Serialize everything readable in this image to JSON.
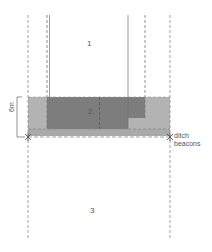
{
  "diagram": {
    "zones": [
      {
        "id": "zone-1",
        "label": "1"
      },
      {
        "id": "zone-2",
        "label": "2"
      },
      {
        "id": "zone-3",
        "label": "3"
      }
    ],
    "dimension": {
      "label": "6m"
    },
    "annotation": {
      "line1": "ditch",
      "line2": "beacons"
    },
    "colors": {
      "band_light": "#b3b3b3",
      "band_dark": "#7a7a7a",
      "strip": "#a6a6a6",
      "line": "#8c8c8c",
      "solid_line": "#6e6e6e",
      "text": "#555555"
    }
  }
}
